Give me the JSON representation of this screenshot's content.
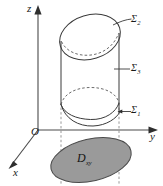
{
  "figure": {
    "kind": "3d-solid-diagram",
    "axes": {
      "z_label": "z",
      "y_label": "y",
      "x_label": "x",
      "origin_label": "O"
    },
    "surfaces": [
      {
        "id": "sigma2",
        "label": "Σ",
        "subscript": "2",
        "role": "top-cap-surface"
      },
      {
        "id": "sigma3",
        "label": "Σ",
        "subscript": "3",
        "role": "lateral-cylinder-surface"
      },
      {
        "id": "sigma1",
        "label": "Σ",
        "subscript": "1",
        "role": "bottom-cap-surface"
      }
    ],
    "projection_region": {
      "label": "D",
      "subscript": "xy",
      "fill_color": "#9a9a9a",
      "stroke_color": "#4a4a4a"
    },
    "colors": {
      "axis": "#4a4a4a",
      "curve": "#3a3a3a",
      "dashed": "#5a5a5a",
      "projection_dash": "#8c8c8c",
      "background": "#ffffff",
      "disk_fill": "#9a9a9a"
    }
  }
}
